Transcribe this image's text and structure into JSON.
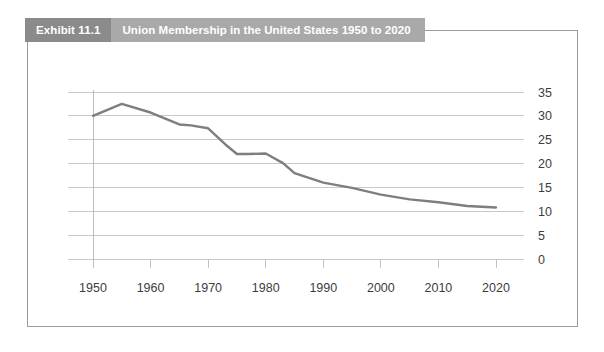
{
  "header": {
    "tag": "Exhibit 11.1",
    "title": "Union Membership in the United States 1950 to 2020"
  },
  "colors": {
    "tag_background": "#8b8b8b",
    "title_background": "#a9a9a9",
    "header_text": "#ffffff",
    "line": "#7e7e7e",
    "gridline": "#c9c9c9",
    "frame_border": "#9a9a9a",
    "axis_text": "#3d3d3d",
    "background": "#ffffff"
  },
  "chart_data": {
    "type": "line",
    "title": "Union Membership in the United States 1950 to 2020",
    "xlabel": "",
    "ylabel": "",
    "xlim": [
      1950,
      2020
    ],
    "ylim": [
      0,
      35
    ],
    "grid": true,
    "legend": false,
    "y_label_position": "right",
    "ytick_labels": [
      "35",
      "30",
      "25",
      "20",
      "15",
      "10",
      "5",
      "0"
    ],
    "yticks": [
      35,
      30,
      25,
      20,
      15,
      10,
      5,
      0
    ],
    "xtick_labels": [
      "1950",
      "1960",
      "1970",
      "1980",
      "1990",
      "2000",
      "2010",
      "2020"
    ],
    "xticks": [
      1950,
      1960,
      1970,
      1980,
      1990,
      2000,
      2010,
      2020
    ],
    "series": [
      {
        "name": "Union membership rate (percent of employed workers)",
        "x": [
          1950,
          1955,
          1960,
          1965,
          1967,
          1970,
          1973,
          1975,
          1977,
          1980,
          1983,
          1985,
          1990,
          1995,
          2000,
          2005,
          2010,
          2015,
          2020
        ],
        "values": [
          30.0,
          32.5,
          30.7,
          28.2,
          28.0,
          27.4,
          24.0,
          22.0,
          22.0,
          22.1,
          20.1,
          18.0,
          16.0,
          14.9,
          13.5,
          12.5,
          11.9,
          11.1,
          10.8
        ]
      }
    ]
  }
}
